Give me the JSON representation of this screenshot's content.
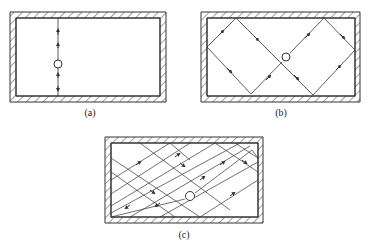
{
  "figure": {
    "panels": [
      {
        "id": "a",
        "label": "(a)",
        "description": "single vertical ray path through source"
      },
      {
        "id": "b",
        "label": "(b)",
        "description": "diamond-shaped closed ray path with 45-degree reflections"
      },
      {
        "id": "c",
        "label": "(c)",
        "description": "multiple oblique ray paths filling rectangle"
      }
    ],
    "colors": {
      "line": "#333333",
      "background": "#ffffff"
    }
  }
}
